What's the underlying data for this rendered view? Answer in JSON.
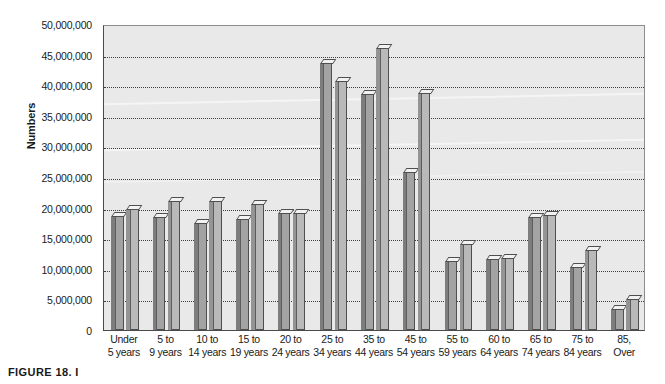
{
  "figure": {
    "caption": "FIGURE 18. I"
  },
  "chart_data": {
    "type": "bar",
    "title": "",
    "xlabel": "",
    "ylabel": "Numbers",
    "ylim": [
      0,
      50000000
    ],
    "grid": true,
    "legend_position": "none",
    "ytick_labels": [
      "50,000,000",
      "45,000,000",
      "40,000,000",
      "35,000,000",
      "30,000,000",
      "25,000,000",
      "20,000,000",
      "15,000,000",
      "10,000,000",
      "5,000,000",
      "0"
    ],
    "ytick_values": [
      50000000,
      45000000,
      40000000,
      35000000,
      30000000,
      25000000,
      20000000,
      15000000,
      10000000,
      5000000,
      0
    ],
    "categories": [
      "Under 5 years",
      "5 to 9 years",
      "10 to 14 years",
      "15 to 19 years",
      "20 to 24 years",
      "25 to 34 years",
      "35 to 44 years",
      "45 to 54 years",
      "55 to 59 years",
      "60 to 64 years",
      "65 to 74 years",
      "75 to 84 years",
      "85, Over"
    ],
    "category_lines": [
      [
        "Under",
        "5 years"
      ],
      [
        "5 to",
        "9 years"
      ],
      [
        "10 to",
        "14 years"
      ],
      [
        "15 to",
        "19 years"
      ],
      [
        "20 to",
        "24 years"
      ],
      [
        "25 to",
        "34 years"
      ],
      [
        "35 to",
        "44 years"
      ],
      [
        "45 to",
        "54 years"
      ],
      [
        "55 to",
        "59 years"
      ],
      [
        "60 to",
        "64 years"
      ],
      [
        "65 to",
        "74 years"
      ],
      [
        "75 to",
        "84 years"
      ],
      [
        "85,",
        "Over"
      ]
    ],
    "series": [
      {
        "name": "Series 1",
        "values": [
          18600000,
          18400000,
          17500000,
          18100000,
          19100000,
          43700000,
          38500000,
          25800000,
          11300000,
          11600000,
          18500000,
          10300000,
          3500000
        ]
      },
      {
        "name": "Series 2",
        "values": [
          19700000,
          21000000,
          21000000,
          20600000,
          19100000,
          40700000,
          46000000,
          38800000,
          14000000,
          11800000,
          18800000,
          13000000,
          5000000
        ]
      }
    ],
    "colors": {
      "series_1": "#a3a3a3",
      "series_2": "#b9b9b9",
      "plot_background": "#e9e9e9",
      "gridline": "#3d3d3d",
      "axis": "#4a4a4a",
      "bar_outline": "#4f4f4f",
      "bar_top_cap": "#f2f2f2"
    }
  }
}
